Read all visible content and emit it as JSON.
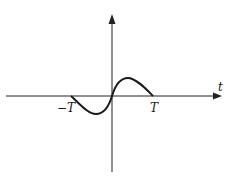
{
  "diagram": {
    "type": "function-plot",
    "axes": {
      "x_label": "t",
      "y_label": ""
    },
    "tick_labels": {
      "negative": "−T",
      "positive": "T"
    },
    "curve": {
      "shape": "odd function: negative lobe on [-T,0], positive lobe on [0,T]",
      "stroke_color": "#1a1a1a"
    },
    "colors": {
      "axis": "#222222",
      "background": "#ffffff"
    }
  }
}
